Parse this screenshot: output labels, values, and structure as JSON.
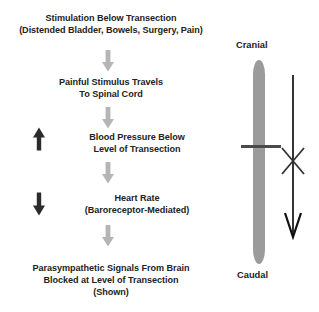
{
  "diagram": {
    "flow_steps": [
      {
        "id": "stimulation",
        "lines": [
          "Stimulation Below Transection",
          "(Distended Bladder, Bowels, Surgery, Pain)"
        ],
        "indicator": null
      },
      {
        "id": "painful-stimulus",
        "lines": [
          "Painful Stimulus Travels",
          "To Spinal Cord"
        ],
        "indicator": null
      },
      {
        "id": "blood-pressure",
        "lines": [
          "Blood Pressure Below",
          "Level of Transection"
        ],
        "indicator": "up-arrow"
      },
      {
        "id": "heart-rate",
        "lines": [
          "Heart Rate",
          "(Baroreceptor-Mediated)"
        ],
        "indicator": "down-arrow"
      },
      {
        "id": "parasympathetic",
        "lines": [
          "Parasympathetic Signals From Brain",
          "Blocked at Level of Transection",
          "(Shown)"
        ],
        "indicator": null
      }
    ],
    "connectors": [
      {
        "id": "connector-1",
        "icon": "down-arrow-icon"
      },
      {
        "id": "connector-2",
        "icon": "down-arrow-icon"
      },
      {
        "id": "connector-3",
        "icon": "down-arrow-icon"
      },
      {
        "id": "connector-4",
        "icon": "down-arrow-icon"
      }
    ],
    "spinal_cord": {
      "cranial_label": "Cranial",
      "caudal_label": "Caudal",
      "transection_label": "",
      "block_marker": "x-block-icon",
      "signal_arrow": "descending-signal-arrow-icon"
    }
  },
  "colors": {
    "connector_gray": "#b5b5b5",
    "cord_gray": "#9b9b9b",
    "indicator_black": "#2b2b2b",
    "transection_dark": "#4a4a4a",
    "text": "#222222",
    "background": "#ffffff"
  }
}
